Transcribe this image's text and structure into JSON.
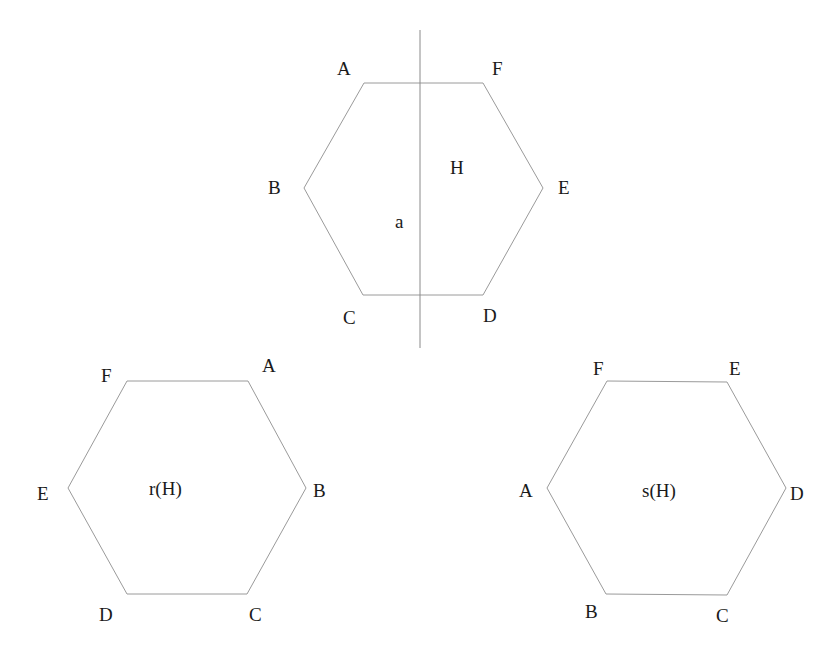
{
  "diagram": {
    "colors": {
      "stroke": "#9a9a9a",
      "text": "#1a1a1a",
      "background": "#ffffff"
    },
    "top_hexagon": {
      "center_label": "H",
      "axis_label": "a",
      "vertices": [
        {
          "label": "A",
          "x": 364,
          "y": 83
        },
        {
          "label": "F",
          "x": 483,
          "y": 83
        },
        {
          "label": "E",
          "x": 543,
          "y": 188
        },
        {
          "label": "D",
          "x": 483,
          "y": 295
        },
        {
          "label": "C",
          "x": 363,
          "y": 295
        },
        {
          "label": "B",
          "x": 304,
          "y": 188
        }
      ],
      "axis": {
        "x": 420,
        "y1": 30,
        "y2": 348
      }
    },
    "left_hexagon": {
      "center_label": "r(H)",
      "vertices": [
        {
          "label": "F",
          "x": 127,
          "y": 381
        },
        {
          "label": "A",
          "x": 248,
          "y": 381
        },
        {
          "label": "B",
          "x": 306,
          "y": 488
        },
        {
          "label": "C",
          "x": 247,
          "y": 594
        },
        {
          "label": "D",
          "x": 127,
          "y": 594
        },
        {
          "label": "E",
          "x": 68,
          "y": 488
        }
      ]
    },
    "right_hexagon": {
      "center_label": "s(H)",
      "vertices": [
        {
          "label": "F",
          "x": 607,
          "y": 381
        },
        {
          "label": "E",
          "x": 727,
          "y": 382
        },
        {
          "label": "D",
          "x": 786,
          "y": 488
        },
        {
          "label": "C",
          "x": 727,
          "y": 595
        },
        {
          "label": "B",
          "x": 606,
          "y": 594
        },
        {
          "label": "A",
          "x": 547,
          "y": 488
        }
      ]
    }
  }
}
